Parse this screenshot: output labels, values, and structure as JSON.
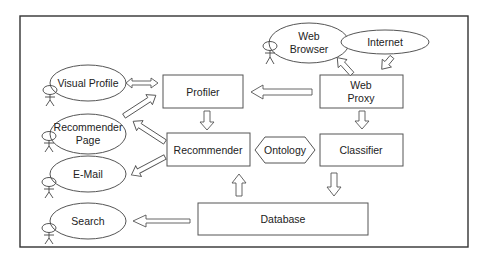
{
  "diagram": {
    "type": "system-architecture",
    "nodes": {
      "visual_profile": {
        "label": "Visual Profile",
        "shape": "ellipse",
        "has_actor": true
      },
      "recommender_page": {
        "label_line1": "Recommender",
        "label_line2": "Page",
        "shape": "ellipse",
        "has_actor": true
      },
      "email": {
        "label": "E-Mail",
        "shape": "ellipse",
        "has_actor": true
      },
      "search": {
        "label": "Search",
        "shape": "ellipse",
        "has_actor": true
      },
      "web_browser": {
        "label_line1": "Web",
        "label_line2": "Browser",
        "shape": "ellipse",
        "has_actor": true
      },
      "internet": {
        "label": "Internet",
        "shape": "ellipse"
      },
      "profiler": {
        "label": "Profiler",
        "shape": "rectangle"
      },
      "web_proxy": {
        "label_line1": "Web",
        "label_line2": "Proxy",
        "shape": "rectangle"
      },
      "recommender": {
        "label": "Recommender",
        "shape": "rectangle"
      },
      "ontology": {
        "label": "Ontology",
        "shape": "hexagon"
      },
      "classifier": {
        "label": "Classifier",
        "shape": "rectangle"
      },
      "database": {
        "label": "Database",
        "shape": "rectangle"
      }
    },
    "edges": [
      {
        "from": "Visual Profile",
        "to": "Profiler",
        "direction": "bidirectional"
      },
      {
        "from": "Recommender Page",
        "to": "Profiler",
        "direction": "forward"
      },
      {
        "from": "Recommender",
        "to": "Recommender Page",
        "direction": "forward"
      },
      {
        "from": "Recommender",
        "to": "E-Mail",
        "direction": "forward"
      },
      {
        "from": "Database",
        "to": "Search",
        "direction": "forward"
      },
      {
        "from": "Profiler",
        "to": "Recommender",
        "direction": "forward"
      },
      {
        "from": "Web Proxy",
        "to": "Profiler",
        "direction": "forward"
      },
      {
        "from": "Web Proxy",
        "to": "Web Browser",
        "direction": "forward"
      },
      {
        "from": "Internet",
        "to": "Web Proxy",
        "direction": "forward"
      },
      {
        "from": "Web Proxy",
        "to": "Classifier",
        "direction": "forward"
      },
      {
        "from": "Classifier",
        "to": "Database",
        "direction": "forward"
      },
      {
        "from": "Database",
        "to": "Recommender",
        "direction": "forward"
      }
    ]
  }
}
